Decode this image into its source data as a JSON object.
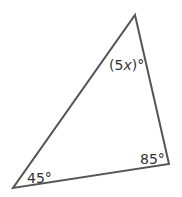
{
  "diagram": {
    "type": "triangle",
    "stroke_color": "#555555",
    "vertices": {
      "top": [
        135,
        15
      ],
      "bottom_right": [
        169,
        164
      ],
      "bottom_left": [
        13,
        188
      ]
    },
    "angles": {
      "top": {
        "prefix": "(5",
        "variable": "x",
        "suffix": ")°"
      },
      "bottom_right": "85°",
      "bottom_left": "45°"
    }
  }
}
